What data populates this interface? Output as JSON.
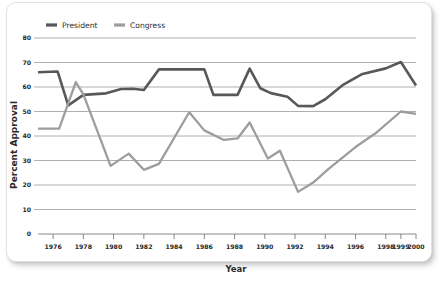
{
  "card": {
    "background": "#ffffff",
    "border_color": "#e2e2e2"
  },
  "legend": {
    "position": "top-left",
    "entries": [
      {
        "label": "President",
        "color": "#58585a",
        "swatch": "line-swatch"
      },
      {
        "label": "Congress",
        "color": "#9d9d9f",
        "swatch": "line-swatch"
      }
    ]
  },
  "chart_data": {
    "type": "line",
    "title": "",
    "xlabel": "Year",
    "ylabel": "Percent Approval",
    "xlim": [
      1975,
      2000
    ],
    "ylim": [
      0,
      80
    ],
    "ytick_step": 10,
    "yticks": [
      0,
      10,
      20,
      30,
      40,
      50,
      60,
      70,
      80
    ],
    "xticks": [
      1976,
      1978,
      1980,
      1982,
      1984,
      1986,
      1988,
      1990,
      1992,
      1994,
      1996,
      1998,
      1999,
      2000
    ],
    "xtick_labels": [
      "1976",
      "1978",
      "1980",
      "1982",
      "1984",
      "1986",
      "1988",
      "1990",
      "1992",
      "1994",
      "1996",
      "1998",
      "1999",
      "2000"
    ],
    "grid": "horizontal",
    "legend_position": "top-left",
    "series": [
      {
        "name": "President",
        "color": "#58585a",
        "linewidth": 2.6,
        "x": [
          1975.0,
          1976.3,
          1977.0,
          1978.0,
          1979.5,
          1980.5,
          1981.3,
          1982.0,
          1983.0,
          1986.0,
          1986.6,
          1988.2,
          1989.0,
          1989.7,
          1990.4,
          1991.5,
          1992.2,
          1993.2,
          1994.0,
          1995.2,
          1996.4,
          1998.0,
          1999.0,
          2000.0
        ],
        "y": [
          66.0,
          66.3,
          52.5,
          56.8,
          57.4,
          59.2,
          59.3,
          58.8,
          67.2,
          67.2,
          56.8,
          56.8,
          67.5,
          59.5,
          57.5,
          56.0,
          52.3,
          52.2,
          55.0,
          61.0,
          65.2,
          67.6,
          70.2,
          60.6
        ]
      },
      {
        "name": "Congress",
        "color": "#9d9d9f",
        "linewidth": 2.3,
        "x": [
          1975.0,
          1976.4,
          1977.5,
          1978.0,
          1979.8,
          1981.0,
          1982.0,
          1983.0,
          1985.0,
          1986.0,
          1987.3,
          1988.2,
          1989.0,
          1990.2,
          1991.0,
          1992.2,
          1993.2,
          1994.2,
          1996.0,
          1997.3,
          1999.0,
          2000.0
        ],
        "y": [
          43.0,
          43.0,
          62.0,
          57.0,
          27.8,
          32.8,
          26.2,
          28.6,
          49.7,
          42.3,
          38.4,
          39.0,
          45.5,
          30.8,
          34.0,
          17.2,
          21.0,
          26.5,
          35.5,
          41.0,
          50.0,
          49.0
        ]
      }
    ],
    "annotations": []
  }
}
